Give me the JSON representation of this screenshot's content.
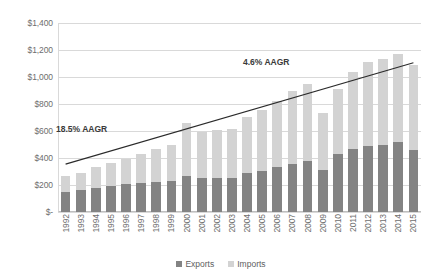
{
  "chart_data": {
    "type": "bar",
    "subtype": "stacked-bar-with-trendline",
    "title": "",
    "xlabel": "",
    "ylabel": "",
    "ylim": [
      0,
      1400
    ],
    "ytick_values": [
      0,
      200,
      400,
      600,
      800,
      1000,
      1200,
      1400
    ],
    "ytick_labels": [
      "$-",
      "$200",
      "$400",
      "$600",
      "$800",
      "$1,000",
      "$1,200",
      "$1,400"
    ],
    "grid": true,
    "legend_position": "bottom",
    "categories": [
      "1992",
      "1993",
      "1994",
      "1995",
      "1996",
      "1997",
      "1998",
      "1999",
      "2000",
      "2001",
      "2002",
      "2003",
      "2004",
      "2005",
      "2006",
      "2007",
      "2008",
      "2009",
      "2010",
      "2011",
      "2012",
      "2013",
      "2014",
      "2015"
    ],
    "series": [
      {
        "name": "Exports",
        "color": "#838383",
        "values": [
          150,
          160,
          180,
          195,
          205,
          215,
          220,
          230,
          265,
          250,
          250,
          255,
          290,
          305,
          330,
          355,
          380,
          310,
          430,
          470,
          490,
          500,
          520,
          460
        ]
      },
      {
        "name": "Imports",
        "color": "#d3d3d3",
        "values": [
          120,
          130,
          150,
          165,
          190,
          215,
          245,
          265,
          395,
          340,
          355,
          360,
          415,
          450,
          490,
          540,
          570,
          420,
          480,
          570,
          620,
          630,
          650,
          630
        ]
      }
    ],
    "totals": [
      270,
      290,
      330,
      360,
      395,
      430,
      465,
      495,
      660,
      590,
      605,
      615,
      705,
      755,
      820,
      895,
      950,
      730,
      910,
      1040,
      1110,
      1130,
      1170,
      1090
    ],
    "annotations": [
      {
        "text": "18.5% AAGR",
        "x_position": "left"
      },
      {
        "text": "4.6% AAGR",
        "x_position": "center-right"
      }
    ],
    "trendline": {
      "start_category": "1992",
      "start_value": 355,
      "end_category": "2015",
      "end_value": 1105
    }
  },
  "legend": {
    "items": [
      {
        "label": "Exports",
        "color": "#838383"
      },
      {
        "label": "Imports",
        "color": "#d3d3d3"
      }
    ]
  }
}
